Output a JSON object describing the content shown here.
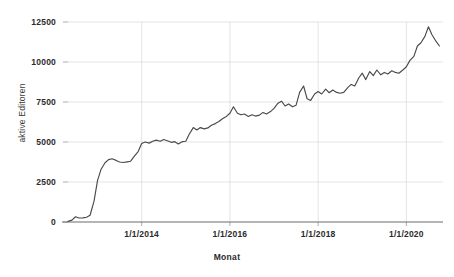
{
  "chart_data": {
    "type": "line",
    "title": "",
    "xlabel": "Monat",
    "ylabel": "aktive Editoren",
    "xlim": [
      2012.33,
      2020.83
    ],
    "ylim": [
      0,
      12500
    ],
    "grid": true,
    "legend": false,
    "y_ticks": [
      0,
      2500,
      5000,
      7500,
      10000,
      12500
    ],
    "y_tick_labels": [
      "0",
      "2500",
      "5000",
      "7500",
      "10000",
      "12500"
    ],
    "x_ticks": [
      2014.0,
      2016.0,
      2018.0,
      2020.0
    ],
    "x_tick_labels": [
      "1/1/2014",
      "1/1/2016",
      "1/1/2018",
      "1/1/2020"
    ],
    "line_color": "#4a4a4a",
    "grid_color": "#d8d8d8",
    "axis_color": "#6d6d6d",
    "series": [
      {
        "name": "aktive Editoren",
        "x": [
          2012.33,
          2012.42,
          2012.5,
          2012.58,
          2012.67,
          2012.75,
          2012.83,
          2012.92,
          2013.0,
          2013.08,
          2013.17,
          2013.25,
          2013.33,
          2013.42,
          2013.5,
          2013.58,
          2013.67,
          2013.75,
          2013.83,
          2013.92,
          2014.0,
          2014.08,
          2014.17,
          2014.25,
          2014.33,
          2014.42,
          2014.5,
          2014.58,
          2014.67,
          2014.75,
          2014.83,
          2014.92,
          2015.0,
          2015.08,
          2015.17,
          2015.25,
          2015.33,
          2015.42,
          2015.5,
          2015.58,
          2015.67,
          2015.75,
          2015.83,
          2015.92,
          2016.0,
          2016.08,
          2016.17,
          2016.25,
          2016.33,
          2016.42,
          2016.5,
          2016.58,
          2016.67,
          2016.75,
          2016.83,
          2016.92,
          2017.0,
          2017.08,
          2017.17,
          2017.25,
          2017.33,
          2017.42,
          2017.5,
          2017.58,
          2017.67,
          2017.75,
          2017.83,
          2017.92,
          2018.0,
          2018.08,
          2018.17,
          2018.25,
          2018.33,
          2018.42,
          2018.5,
          2018.58,
          2018.67,
          2018.75,
          2018.83,
          2018.92,
          2019.0,
          2019.08,
          2019.17,
          2019.25,
          2019.33,
          2019.42,
          2019.5,
          2019.58,
          2019.67,
          2019.75,
          2019.83,
          2019.92,
          2020.0,
          2020.08,
          2020.17,
          2020.25,
          2020.33,
          2020.42,
          2020.5,
          2020.58,
          2020.67,
          2020.75
        ],
        "values": [
          40,
          120,
          330,
          250,
          260,
          300,
          420,
          1300,
          2600,
          3300,
          3700,
          3900,
          3950,
          3850,
          3750,
          3720,
          3760,
          3800,
          4100,
          4400,
          4900,
          5000,
          4930,
          5050,
          5120,
          5050,
          5160,
          5080,
          4980,
          5020,
          4880,
          5020,
          5050,
          5500,
          5900,
          5750,
          5900,
          5820,
          5880,
          6050,
          6150,
          6280,
          6450,
          6600,
          6800,
          7200,
          6800,
          6700,
          6750,
          6600,
          6700,
          6620,
          6680,
          6850,
          6750,
          6900,
          7100,
          7400,
          7550,
          7250,
          7380,
          7200,
          7300,
          8100,
          8500,
          7700,
          7600,
          8000,
          8150,
          8000,
          8300,
          8080,
          8250,
          8100,
          8050,
          8100,
          8400,
          8600,
          8500,
          9000,
          9300,
          8900,
          9400,
          9150,
          9500,
          9200,
          9350,
          9250,
          9450,
          9350,
          9300,
          9500,
          9700,
          10100,
          10350,
          11000,
          11200,
          11600,
          12200,
          11700,
          11300,
          11000
        ]
      }
    ]
  },
  "axes": {
    "ylabel": "aktive Editoren",
    "xlabel": "Monat"
  }
}
